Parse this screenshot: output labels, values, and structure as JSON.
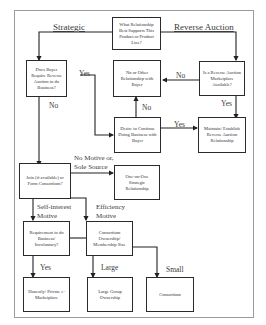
{
  "diagram": {
    "type": "flowchart",
    "boxes": {
      "root": "What Relationship Best Supports This Product or Product Line?",
      "buyer_require": "Does Buyer Require Reverse Auction to do Business?",
      "no_other": "No or Other Relationship with Buyer",
      "ra_available": "Is a Reverse Auction Marketplace Available?",
      "desire_continue": "Desire to Continue Doing Business with Buyer",
      "maintain_ra": "Maintain/ Establish Reverse Auction Relationship",
      "join_consortium": "Join (if available) or Form Consortium?",
      "one_on_one": "One-on-One Strategic Relationship",
      "requirement_involuntary": "Requirement to do Business/ Involuntary?",
      "consortium_size": "Consortium Ownership/ Membership Size",
      "private_marketplace": "Honestly/ Private e-Marketplace",
      "large_group": "Large Group Ownership",
      "consortium": "Consortium"
    },
    "labels": {
      "strategic": "Strategic",
      "reverse_auction": "Reverse Auction",
      "yes_buyer": "Yes",
      "no_buyer": "No",
      "no_ra": "No",
      "yes_ra": "Yes",
      "no_desire": "No",
      "yes_desire": "Yes",
      "no_motive": "No Motive or, Sole Source",
      "self_interest": "Self-interest Motive",
      "efficiency": "Efficiency Motive",
      "yes_req": "Yes",
      "large": "Large",
      "small": "Small"
    }
  }
}
